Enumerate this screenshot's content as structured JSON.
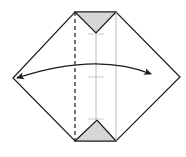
{
  "diagram": {
    "type": "origami-fold-step",
    "colors": {
      "background": "#ffffff",
      "outline": "#1a1a1a",
      "shaded_flap": "#d6d6d6",
      "crease": "#a8a8a8",
      "arrow": "#1a1a1a"
    },
    "shape": {
      "points": "75,12 116,12 180,77 116,141 75,141 13,78"
    },
    "flaps": [
      {
        "name": "top-flap",
        "points": "75,12 116,12 96,33"
      },
      {
        "name": "bottom-flap",
        "points": "75,141 116,141 97,120"
      }
    ],
    "lines": {
      "valley_fold": {
        "x1": 75,
        "y1": 12,
        "x2": 75,
        "y2": 141
      },
      "center_crease": {
        "x1": 96,
        "y1": 33,
        "x2": 96,
        "y2": 120
      },
      "right_crease": {
        "x1": 116,
        "y1": 12,
        "x2": 116,
        "y2": 141
      }
    },
    "ticks": [
      {
        "x1": 88,
        "y1": 34,
        "x2": 104,
        "y2": 34
      },
      {
        "x1": 88,
        "y1": 77,
        "x2": 104,
        "y2": 77
      },
      {
        "x1": 88,
        "y1": 119,
        "x2": 104,
        "y2": 119
      }
    ],
    "arrow": {
      "path": "M 17,78 Q 96,52 151,74",
      "description": "two-way arrow: fold and unfold"
    }
  }
}
